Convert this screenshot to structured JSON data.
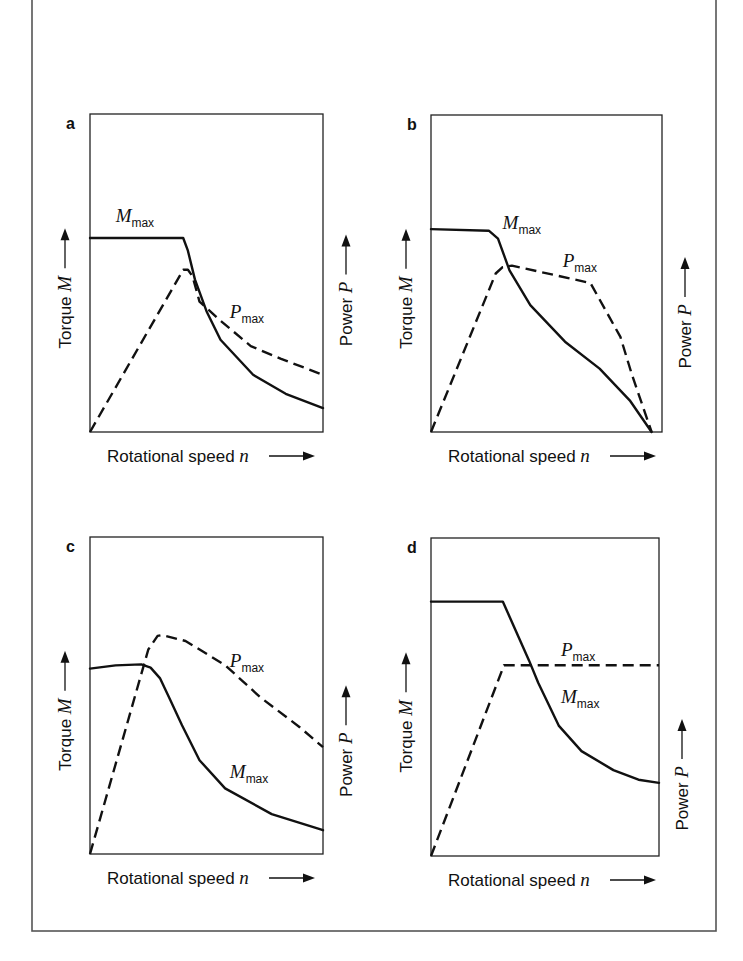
{
  "figure": {
    "frame": {
      "x": 32,
      "y": -2,
      "w": 684,
      "h": 933
    },
    "axis_labels": {
      "x": {
        "text": "Rotational speed ",
        "var": "n"
      },
      "y_left": {
        "text": "Torque ",
        "var": "M"
      },
      "y_right": {
        "text": "Power ",
        "var": "P"
      }
    },
    "curve_labels": {
      "torque": {
        "var": "M",
        "sub": "max"
      },
      "power": {
        "var": "P",
        "sub": "max"
      }
    }
  },
  "chart_data": [
    {
      "type": "line",
      "panel": "a",
      "title": "a",
      "xlabel": "Rotational speed n",
      "ylabel": "Torque M",
      "ylabel_right": "Power P",
      "box": {
        "x": 90,
        "y": 114,
        "w": 233,
        "h": 318
      },
      "x_range": [
        0,
        1
      ],
      "y_range": [
        0,
        1
      ],
      "grid": false,
      "series": [
        {
          "name": "M_max",
          "style": "solid",
          "points": [
            [
              0,
              0.61
            ],
            [
              0.4,
              0.61
            ],
            [
              0.42,
              0.57
            ],
            [
              0.45,
              0.48
            ],
            [
              0.5,
              0.38
            ],
            [
              0.56,
              0.29
            ],
            [
              0.7,
              0.18
            ],
            [
              0.84,
              0.12
            ],
            [
              1.0,
              0.075
            ]
          ]
        },
        {
          "name": "P_max",
          "style": "dashed",
          "points": [
            [
              0,
              0
            ],
            [
              0.4,
              0.51
            ],
            [
              0.42,
              0.51
            ],
            [
              0.44,
              0.49
            ],
            [
              0.47,
              0.41
            ],
            [
              0.56,
              0.35
            ],
            [
              0.69,
              0.27
            ],
            [
              0.82,
              0.23
            ],
            [
              1.0,
              0.18
            ]
          ]
        }
      ],
      "labels": [
        {
          "series": "M_max",
          "x": 0.11,
          "y": 0.66
        },
        {
          "series": "P_max",
          "x": 0.6,
          "y": 0.36
        }
      ]
    },
    {
      "type": "line",
      "panel": "b",
      "title": "b",
      "xlabel": "Rotational speed n",
      "ylabel": "Torque M",
      "ylabel_right": "Power P",
      "box": {
        "x": 431,
        "y": 115,
        "w": 231,
        "h": 317
      },
      "x_range": [
        0,
        1
      ],
      "y_range": [
        0,
        1
      ],
      "grid": false,
      "series": [
        {
          "name": "M_max",
          "style": "solid",
          "points": [
            [
              0,
              0.64
            ],
            [
              0.25,
              0.635
            ],
            [
              0.29,
              0.61
            ],
            [
              0.34,
              0.51
            ],
            [
              0.43,
              0.4
            ],
            [
              0.58,
              0.285
            ],
            [
              0.73,
              0.2
            ],
            [
              0.86,
              0.1
            ],
            [
              0.955,
              0
            ]
          ]
        },
        {
          "name": "P_max",
          "style": "dashed",
          "points": [
            [
              0,
              0
            ],
            [
              0.28,
              0.5
            ],
            [
              0.31,
              0.52
            ],
            [
              0.35,
              0.525
            ],
            [
              0.69,
              0.47
            ],
            [
              0.82,
              0.3
            ],
            [
              0.87,
              0.18
            ],
            [
              0.955,
              0
            ]
          ]
        }
      ],
      "labels": [
        {
          "series": "M_max",
          "x": 0.31,
          "y": 0.64
        },
        {
          "series": "P_max",
          "x": 0.57,
          "y": 0.52
        }
      ]
    },
    {
      "type": "line",
      "panel": "c",
      "title": "c",
      "xlabel": "Rotational speed n",
      "ylabel": "Torque M",
      "ylabel_right": "Power P",
      "box": {
        "x": 90,
        "y": 537,
        "w": 233,
        "h": 317
      },
      "x_range": [
        0,
        1
      ],
      "y_range": [
        0,
        1
      ],
      "grid": false,
      "series": [
        {
          "name": "M_max",
          "style": "solid",
          "points": [
            [
              0,
              0.585
            ],
            [
              0.11,
              0.595
            ],
            [
              0.22,
              0.598
            ],
            [
              0.26,
              0.588
            ],
            [
              0.3,
              0.555
            ],
            [
              0.345,
              0.485
            ],
            [
              0.395,
              0.406
            ],
            [
              0.47,
              0.296
            ],
            [
              0.58,
              0.207
            ],
            [
              0.78,
              0.126
            ],
            [
              1.0,
              0.075
            ]
          ]
        },
        {
          "name": "P_max",
          "style": "dashed",
          "points": [
            [
              0,
              0
            ],
            [
              0.25,
              0.645
            ],
            [
              0.29,
              0.688
            ],
            [
              0.31,
              0.691
            ],
            [
              0.41,
              0.672
            ],
            [
              0.58,
              0.596
            ],
            [
              0.73,
              0.495
            ],
            [
              0.9,
              0.4
            ],
            [
              1.0,
              0.337
            ]
          ]
        }
      ],
      "labels": [
        {
          "series": "M_max",
          "x": 0.6,
          "y": 0.24
        },
        {
          "series": "P_max",
          "x": 0.6,
          "y": 0.59
        }
      ]
    },
    {
      "type": "line",
      "panel": "d",
      "title": "d",
      "xlabel": "Rotational speed n",
      "ylabel": "Torque M",
      "ylabel_right": "Power P",
      "box": {
        "x": 431,
        "y": 538,
        "w": 228,
        "h": 318
      },
      "x_range": [
        0,
        1
      ],
      "y_range": [
        0,
        1
      ],
      "grid": false,
      "series": [
        {
          "name": "M_max",
          "style": "solid",
          "points": [
            [
              0,
              0.8
            ],
            [
              0.315,
              0.8
            ],
            [
              0.43,
              0.615
            ],
            [
              0.47,
              0.545
            ],
            [
              0.56,
              0.41
            ],
            [
              0.66,
              0.33
            ],
            [
              0.8,
              0.27
            ],
            [
              0.91,
              0.24
            ],
            [
              1.0,
              0.23
            ]
          ]
        },
        {
          "name": "P_max",
          "style": "dashed",
          "points": [
            [
              0,
              0
            ],
            [
              0.32,
              0.6
            ],
            [
              1.0,
              0.6
            ]
          ]
        }
      ],
      "labels": [
        {
          "series": "P_max",
          "x": 0.57,
          "y": 0.63
        },
        {
          "series": "M_max",
          "x": 0.57,
          "y": 0.48
        }
      ]
    }
  ]
}
